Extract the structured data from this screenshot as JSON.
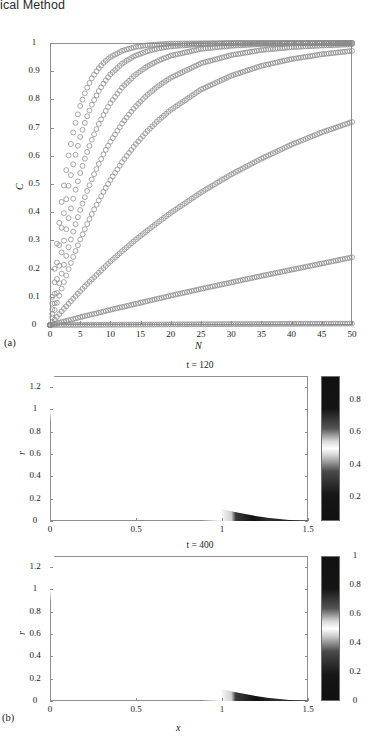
{
  "header": {
    "running_title": "ical Method"
  },
  "figure": {
    "panel_a_label": "(a)",
    "panel_b_label": "(b)"
  },
  "chart_data": [
    {
      "id": "panel-a",
      "type": "line",
      "title": "",
      "xlabel": "N",
      "ylabel": "C",
      "xlim": [
        0,
        50
      ],
      "ylim": [
        0,
        1
      ],
      "xticks": [
        0,
        5,
        10,
        15,
        20,
        25,
        30,
        35,
        40,
        45,
        50
      ],
      "xtick_labels": [
        "0",
        "5",
        "10",
        "15",
        "20",
        "25",
        "30",
        "35",
        "40",
        "45",
        "50"
      ],
      "yticks": [
        0,
        0.1,
        0.2,
        0.3,
        0.4,
        0.5,
        0.6,
        0.7,
        0.8,
        0.9,
        1
      ],
      "ytick_labels": [
        "0",
        "0.1",
        "0.2",
        "0.3",
        "0.4",
        "0.5",
        "0.6",
        "0.7",
        "0.8",
        "0.9",
        "1"
      ],
      "grid": false,
      "legend": "none",
      "marker": "open-circle",
      "marker_color": "#8a8a8a",
      "series": [
        {
          "name": "curve-1",
          "rate": 0.3,
          "endpoint": 1.0,
          "x": [
            0,
            1,
            2,
            3,
            4,
            5,
            6,
            7,
            8,
            9,
            10,
            12,
            14,
            16,
            18,
            20,
            25,
            30,
            35,
            40,
            45,
            50
          ],
          "values": [
            0,
            0.259,
            0.451,
            0.593,
            0.699,
            0.777,
            0.835,
            0.878,
            0.909,
            0.933,
            0.95,
            0.973,
            0.985,
            0.992,
            0.995,
            0.998,
            0.999,
            1.0,
            1.0,
            1.0,
            1.0,
            1.0
          ]
        },
        {
          "name": "curve-2",
          "rate": 0.22,
          "endpoint": 1.0,
          "x": [
            0,
            1,
            2,
            3,
            4,
            5,
            6,
            7,
            8,
            9,
            10,
            12,
            14,
            16,
            18,
            20,
            25,
            30,
            35,
            40,
            45,
            50
          ],
          "values": [
            0,
            0.197,
            0.357,
            0.486,
            0.585,
            0.667,
            0.732,
            0.785,
            0.827,
            0.861,
            0.889,
            0.928,
            0.954,
            0.97,
            0.981,
            0.988,
            0.996,
            0.999,
            1.0,
            1.0,
            1.0,
            1.0
          ]
        },
        {
          "name": "curve-3",
          "rate": 0.155,
          "endpoint": 1.0,
          "x": [
            0,
            1,
            2,
            3,
            4,
            5,
            6,
            7,
            8,
            9,
            10,
            12,
            14,
            16,
            18,
            20,
            25,
            30,
            35,
            40,
            45,
            50
          ],
          "values": [
            0,
            0.144,
            0.267,
            0.372,
            0.462,
            0.539,
            0.605,
            0.661,
            0.71,
            0.751,
            0.787,
            0.844,
            0.885,
            0.916,
            0.938,
            0.955,
            0.979,
            0.99,
            0.996,
            0.998,
            0.999,
            1.0
          ]
        },
        {
          "name": "curve-4",
          "rate": 0.105,
          "endpoint": 0.995,
          "x": [
            0,
            1,
            2,
            3,
            4,
            5,
            6,
            7,
            8,
            9,
            10,
            12,
            14,
            16,
            18,
            20,
            25,
            30,
            35,
            40,
            45,
            50
          ],
          "values": [
            0,
            0.1,
            0.189,
            0.27,
            0.342,
            0.408,
            0.467,
            0.52,
            0.568,
            0.612,
            0.65,
            0.717,
            0.771,
            0.814,
            0.849,
            0.877,
            0.928,
            0.957,
            0.975,
            0.985,
            0.991,
            0.995
          ]
        },
        {
          "name": "curve-5",
          "rate": 0.072,
          "endpoint": 0.972,
          "x": [
            0,
            1,
            2,
            3,
            4,
            5,
            6,
            7,
            8,
            9,
            10,
            12,
            14,
            16,
            18,
            20,
            25,
            30,
            35,
            40,
            45,
            50
          ],
          "values": [
            0,
            0.069,
            0.134,
            0.194,
            0.25,
            0.303,
            0.351,
            0.397,
            0.439,
            0.478,
            0.514,
            0.58,
            0.636,
            0.685,
            0.727,
            0.763,
            0.835,
            0.884,
            0.919,
            0.943,
            0.96,
            0.972
          ]
        },
        {
          "name": "curve-6",
          "rate": 0.0255,
          "endpoint": 0.72,
          "x": [
            0,
            2,
            4,
            6,
            8,
            10,
            12,
            14,
            16,
            18,
            20,
            25,
            30,
            35,
            40,
            45,
            50
          ],
          "values": [
            0,
            0.05,
            0.097,
            0.142,
            0.184,
            0.225,
            0.263,
            0.299,
            0.333,
            0.366,
            0.398,
            0.47,
            0.534,
            0.59,
            0.64,
            0.683,
            0.72
          ]
        },
        {
          "name": "curve-7",
          "rate": 0.0055,
          "endpoint": 0.24,
          "x": [
            0,
            2,
            4,
            6,
            8,
            10,
            12,
            14,
            16,
            18,
            20,
            25,
            30,
            35,
            40,
            45,
            50
          ],
          "values": [
            0,
            0.011,
            0.022,
            0.033,
            0.043,
            0.054,
            0.064,
            0.074,
            0.084,
            0.094,
            0.104,
            0.128,
            0.151,
            0.174,
            0.196,
            0.218,
            0.24
          ]
        },
        {
          "name": "curve-8",
          "rate": 0.0001,
          "endpoint": 0.005,
          "x": [
            0,
            2,
            4,
            6,
            8,
            10,
            12,
            14,
            16,
            18,
            20,
            25,
            30,
            35,
            40,
            45,
            50
          ],
          "values": [
            0,
            0.0002,
            0.0004,
            0.0006,
            0.0008,
            0.001,
            0.0012,
            0.0014,
            0.0016,
            0.0018,
            0.002,
            0.0025,
            0.003,
            0.0035,
            0.004,
            0.0045,
            0.005
          ]
        }
      ]
    },
    {
      "id": "panel-b-top",
      "type": "heatmap",
      "title": "t = 120",
      "xlabel": "",
      "ylabel": "r",
      "xlim": [
        0,
        1.5
      ],
      "ylim": [
        0,
        1.3
      ],
      "xticks": [
        0,
        0.5,
        1,
        1.5
      ],
      "xtick_labels": [
        "0",
        "0.5",
        "1",
        "1.5"
      ],
      "yticks": [
        0,
        0.2,
        0.4,
        0.6,
        0.8,
        1,
        1.2
      ],
      "ytick_labels": [
        "0",
        "0.2",
        "0.4",
        "0.6",
        "0.8",
        "1",
        "1.2"
      ],
      "colorbar": {
        "ticks": [
          0.2,
          0.4,
          0.6,
          0.8
        ],
        "tick_labels": [
          "0.2",
          "0.4",
          "0.6",
          "0.8"
        ],
        "vmin": 0.05,
        "vmax": 0.95,
        "reversed": true
      },
      "field": {
        "description": "annular quarter-ring, inner radius 1.0 outer radius 1.57, dark high-value with bright low-value band",
        "inner_radius": 1.0,
        "outer_radius": 1.57,
        "band_radius": 1.18,
        "band_width": 0.1
      }
    },
    {
      "id": "panel-b-bottom",
      "type": "heatmap",
      "title": "t = 400",
      "xlabel": "x",
      "ylabel": "r",
      "xlim": [
        0,
        1.5
      ],
      "ylim": [
        0,
        1.3
      ],
      "xticks": [
        0,
        0.5,
        1,
        1.5
      ],
      "xtick_labels": [
        "0",
        "0.5",
        "1",
        "1.5"
      ],
      "yticks": [
        0,
        0.2,
        0.4,
        0.6,
        0.8,
        1,
        1.2
      ],
      "ytick_labels": [
        "0",
        "0.2",
        "0.4",
        "0.6",
        "0.8",
        "1",
        "1.2"
      ],
      "colorbar": {
        "ticks": [
          0,
          0.2,
          0.4,
          0.6,
          0.8,
          1
        ],
        "tick_labels": [
          "0",
          "0.2",
          "0.4",
          "0.6",
          "0.8",
          "1"
        ],
        "vmin": 0,
        "vmax": 1,
        "reversed": true
      },
      "field": {
        "description": "annular quarter-ring, inner radius 1.0 outer radius 1.57, dark high-value with bright low-value band",
        "inner_radius": 1.0,
        "outer_radius": 1.57,
        "band_radius": 1.2,
        "band_width": 0.12
      }
    }
  ]
}
